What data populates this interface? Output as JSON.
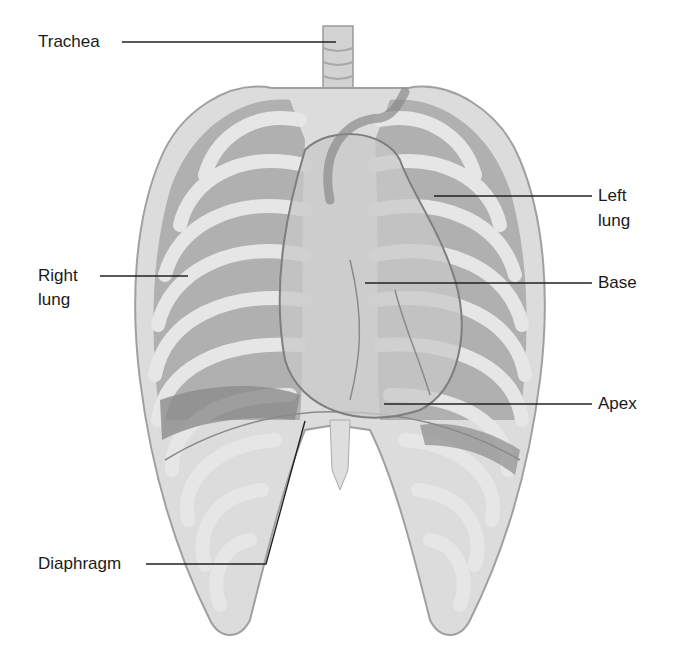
{
  "diagram": {
    "labels": {
      "trachea": "Trachea",
      "left_lung_1": "Left",
      "left_lung_2": "lung",
      "right_lung_1": "Right",
      "right_lung_2": "lung",
      "base": "Base",
      "apex": "Apex",
      "diaphragm": "Diaphragm"
    },
    "colors": {
      "bone": "#d9d9d9",
      "bone_edge": "#9a9a9a",
      "lung": "#a9a9a9",
      "lung_dark": "#8a8a8a",
      "heart": "#c4c4c4",
      "heart_edge": "#7a7a7a",
      "leader": "#222222"
    }
  }
}
